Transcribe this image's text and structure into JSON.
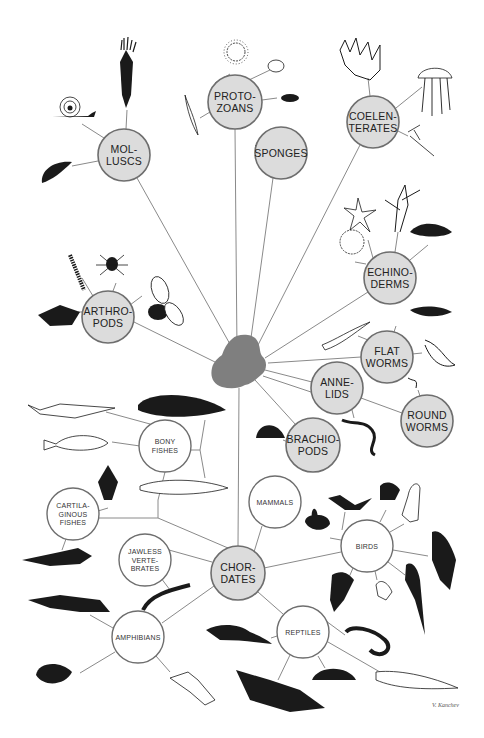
{
  "diagram": {
    "center": {
      "x": 240,
      "y": 362,
      "color": "#7f7f7f"
    },
    "nodes": [
      {
        "id": "molluscs",
        "lines": [
          "MOL-",
          "LUSCS"
        ],
        "x": 124,
        "y": 155,
        "r": 26,
        "style": "filled"
      },
      {
        "id": "protozoans",
        "lines": [
          "PROTO-",
          "ZOANS"
        ],
        "x": 235,
        "y": 102,
        "r": 27,
        "style": "filled"
      },
      {
        "id": "sponges",
        "lines": [
          "SPONGES"
        ],
        "x": 281,
        "y": 153,
        "r": 26,
        "style": "filled"
      },
      {
        "id": "coelenterates",
        "lines": [
          "COELEN-",
          "TERATES"
        ],
        "x": 373,
        "y": 122,
        "r": 26,
        "style": "filled"
      },
      {
        "id": "echinoderms",
        "lines": [
          "ECHINO-",
          "DERMS"
        ],
        "x": 390,
        "y": 278,
        "r": 26,
        "style": "filled"
      },
      {
        "id": "arthropods",
        "lines": [
          "ARTHRO-",
          "PODS"
        ],
        "x": 108,
        "y": 317,
        "r": 26,
        "style": "filled"
      },
      {
        "id": "flatworms",
        "lines": [
          "FLAT",
          "WORMS"
        ],
        "x": 387,
        "y": 357,
        "r": 26,
        "style": "filled"
      },
      {
        "id": "annelids",
        "lines": [
          "ANNE-",
          "LIDS"
        ],
        "x": 337,
        "y": 388,
        "r": 26,
        "style": "filled"
      },
      {
        "id": "roundworms",
        "lines": [
          "ROUND",
          "WORMS"
        ],
        "x": 427,
        "y": 421,
        "r": 26,
        "style": "filled"
      },
      {
        "id": "brachiopods",
        "lines": [
          "BRACHIO-",
          "PODS"
        ],
        "x": 313,
        "y": 445,
        "r": 27,
        "style": "filled"
      },
      {
        "id": "chordates",
        "lines": [
          "CHOR-",
          "DATES"
        ],
        "x": 238,
        "y": 573,
        "r": 27,
        "style": "filled"
      },
      {
        "id": "bony-fishes",
        "lines": [
          "BONY",
          "FISHES"
        ],
        "x": 165,
        "y": 446,
        "r": 26,
        "style": "open"
      },
      {
        "id": "mammals",
        "lines": [
          "MAMMALS"
        ],
        "x": 275,
        "y": 502,
        "r": 26,
        "style": "open"
      },
      {
        "id": "cartilaginous-fishes",
        "lines": [
          "CARTILA-",
          "GINOUS",
          "FISHES"
        ],
        "x": 73,
        "y": 514,
        "r": 26,
        "style": "open"
      },
      {
        "id": "jawless-vertebrates",
        "lines": [
          "JAWLESS",
          "VERTE-",
          "BRATES"
        ],
        "x": 145,
        "y": 560,
        "r": 26,
        "style": "open"
      },
      {
        "id": "birds",
        "lines": [
          "BIRDS"
        ],
        "x": 367,
        "y": 546,
        "r": 26,
        "style": "open"
      },
      {
        "id": "amphibians",
        "lines": [
          "AMPHIBIANS"
        ],
        "x": 138,
        "y": 637,
        "r": 26,
        "style": "open"
      },
      {
        "id": "reptiles",
        "lines": [
          "REPTILES"
        ],
        "x": 303,
        "y": 632,
        "r": 26,
        "style": "open"
      }
    ],
    "signature": "V. Kanchev",
    "colors": {
      "node_fill": "#dcdcdc",
      "node_stroke": "#6e6e6e",
      "edge": "#8a8a8a",
      "ink": "#1a1a1a"
    }
  }
}
